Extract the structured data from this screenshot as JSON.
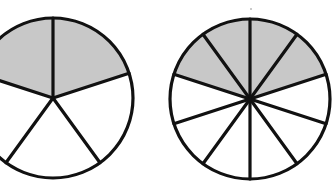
{
  "figure": {
    "background_color": "#ffffff",
    "stroke_color": "#111111",
    "fill_shaded_color": "#c8c8c8",
    "fill_unshaded_color": "#ffffff",
    "stroke_width": 3.2,
    "stray_mark": {
      "x": 250,
      "y": 8,
      "label": "speck"
    }
  },
  "chart_data": {
    "type": "pie",
    "xlabel": "",
    "ylabel": "",
    "legend": [],
    "charts": [
      {
        "name": "left-circle",
        "label": "2/5",
        "center_x": 53,
        "center_y": 98,
        "radius": 80,
        "total_sectors": 5,
        "shaded_sectors": 2,
        "unshaded_sectors": 3,
        "fraction_numerator": 2,
        "fraction_denominator": 5,
        "fraction_value": 0.4,
        "sector_angle_degrees": 72,
        "start_angle_degrees": -72,
        "shaded_span_degrees": 144,
        "clipped_left_edge": true,
        "categories": [
          "shaded",
          "unshaded"
        ],
        "values": [
          2,
          3
        ]
      },
      {
        "name": "right-circle",
        "label": "4/10",
        "center_x": 250,
        "center_y": 99,
        "radius": 80,
        "total_sectors": 10,
        "shaded_sectors": 4,
        "unshaded_sectors": 6,
        "fraction_numerator": 4,
        "fraction_denominator": 10,
        "fraction_value": 0.4,
        "sector_angle_degrees": 36,
        "start_angle_degrees": -72,
        "shaded_span_degrees": 144,
        "clipped_left_edge": false,
        "categories": [
          "shaded",
          "unshaded"
        ],
        "values": [
          4,
          6
        ]
      }
    ]
  }
}
